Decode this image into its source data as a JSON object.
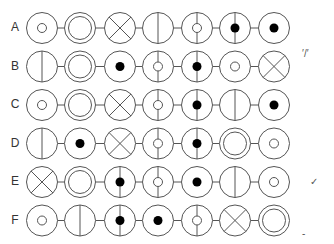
{
  "colors": {
    "stroke": "#555555",
    "fill": "#000000",
    "label": "#333333"
  },
  "layout": {
    "col_x": [
      42,
      80,
      120,
      158,
      197,
      235,
      274
    ],
    "row_y0": 28,
    "row_step": 38.5,
    "radius": 15.5
  },
  "rows": [
    {
      "label": "A",
      "cells": [
        "small-open",
        "double",
        "cross",
        "vline",
        "vline-small-open",
        "vline-dot",
        "dot"
      ]
    },
    {
      "label": "B",
      "cells": [
        "vline",
        "double",
        "dot",
        "vline-small-open",
        "vline-dot",
        "small-open",
        "cross"
      ]
    },
    {
      "label": "C",
      "cells": [
        "small-open",
        "double",
        "cross",
        "vline-small-open",
        "vline-dot",
        "vline",
        "dot"
      ]
    },
    {
      "label": "D",
      "cells": [
        "vline",
        "dot",
        "cross",
        "vline-small-open",
        "vline-dot",
        "double",
        "small-open"
      ]
    },
    {
      "label": "E",
      "cells": [
        "cross",
        "double",
        "vline-dot",
        "vline-small-open",
        "dot",
        "vline",
        "small-open"
      ]
    },
    {
      "label": "F",
      "cells": [
        "small-open",
        "vline",
        "vline-dot",
        "dot",
        "vline-small-open",
        "cross",
        "double"
      ]
    }
  ],
  "marks": [
    {
      "text": "′/′",
      "x": 302,
      "y": 48,
      "row": "B"
    },
    {
      "text": "✓",
      "x": 310,
      "y": 176,
      "row": "E"
    },
    {
      "text": "-",
      "x": 302,
      "y": 228,
      "row": "F"
    }
  ]
}
